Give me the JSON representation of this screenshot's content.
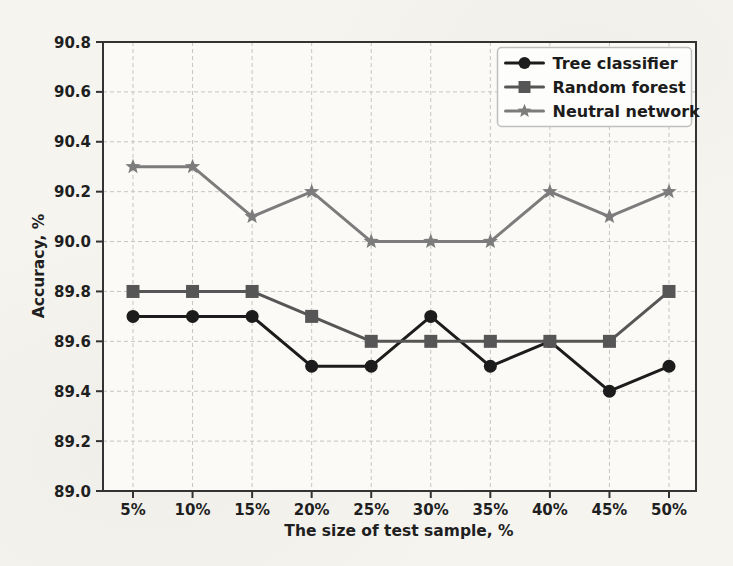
{
  "page": {
    "background_color": "#f5f4ef"
  },
  "chart_data": {
    "type": "line",
    "title": "",
    "xlabel": "The size of test sample, %",
    "ylabel": "Accuracy, %",
    "categories": [
      "5%",
      "10%",
      "15%",
      "20%",
      "25%",
      "30%",
      "35%",
      "40%",
      "45%",
      "50%"
    ],
    "ylim": [
      89.0,
      90.8
    ],
    "y_tick_step": 0.2,
    "y_tick_labels": [
      "89.0",
      "89.2",
      "89.4",
      "89.6",
      "89.8",
      "90.0",
      "90.2",
      "90.4",
      "90.6",
      "90.8"
    ],
    "grid": true,
    "grid_style": "dashed",
    "legend_position": "upper right",
    "series": [
      {
        "name": "Tree classifier",
        "marker": "circle",
        "color": "#1c1c1c",
        "values": [
          89.7,
          89.7,
          89.7,
          89.5,
          89.5,
          89.7,
          89.5,
          89.6,
          89.4,
          89.5
        ]
      },
      {
        "name": "Random forest",
        "marker": "square",
        "color": "#565656",
        "values": [
          89.8,
          89.8,
          89.8,
          89.7,
          89.6,
          89.6,
          89.6,
          89.6,
          89.6,
          89.8
        ]
      },
      {
        "name": "Neutral network",
        "marker": "star",
        "color": "#7c7c7c",
        "values": [
          90.3,
          90.3,
          90.1,
          90.2,
          90.0,
          90.0,
          90.0,
          90.2,
          90.1,
          90.2
        ]
      }
    ],
    "colors": {
      "grid": "#c5c5c3",
      "spine": "#333333",
      "tick_text": "#1f1f1f",
      "legend_border": "#bfbfbd",
      "legend_bg": "#fdfdfb",
      "plot_bg": "#fbfaf6"
    }
  }
}
